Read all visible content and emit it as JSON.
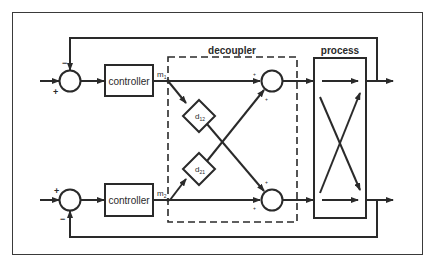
{
  "diagram": {
    "type": "block-diagram",
    "colors": {
      "line": "#2a2a2a",
      "background": "#ffffff",
      "frame": "#3a3a3a"
    },
    "groups": {
      "decoupler": {
        "label": "decoupler",
        "style": "dashed"
      },
      "process": {
        "label": "process",
        "style": "solid"
      }
    },
    "blocks": {
      "controller_top": {
        "label": "controller"
      },
      "controller_bottom": {
        "label": "controller"
      },
      "d12": {
        "label": "d",
        "subscript": "12"
      },
      "d21": {
        "label": "d",
        "subscript": "21"
      }
    },
    "signals": {
      "m1": {
        "label": "m",
        "subscript": "1"
      },
      "m2": {
        "label": "m",
        "subscript": "2"
      }
    },
    "summing_junctions": {
      "left_top": {
        "reference_sign": "+",
        "feedback_sign": "−"
      },
      "left_bottom": {
        "reference_sign": "+",
        "feedback_sign": "−"
      },
      "right_top": {
        "signs": [
          "+",
          "+"
        ]
      },
      "right_bottom": {
        "signs": [
          "+",
          "+"
        ]
      }
    }
  }
}
